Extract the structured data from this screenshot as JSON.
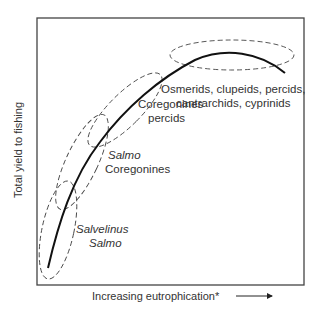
{
  "diagram": {
    "x_axis_label": "Increasing eutrophication*",
    "y_axis_label": "Total yield to fishing",
    "curve_description": "Yield rises with eutrophication, peaks, then declines",
    "zones": [
      {
        "line1": "Salvelinus",
        "line2": "Salmo",
        "italic1": true,
        "italic2": true
      },
      {
        "line1": "Salmo",
        "line2": "Coregonines",
        "italic1": true,
        "italic2": false
      },
      {
        "line1": "Coregonines",
        "line2": "percids",
        "italic1": false,
        "italic2": false
      },
      {
        "line1": "Osmerids, clupeids, percids,",
        "line2": "cantrarchids, cyprinids",
        "italic1": false,
        "italic2": false
      }
    ]
  },
  "colors": {
    "line": "#111111",
    "dash": "#444444",
    "frame": "#444444",
    "text": "#333333"
  }
}
